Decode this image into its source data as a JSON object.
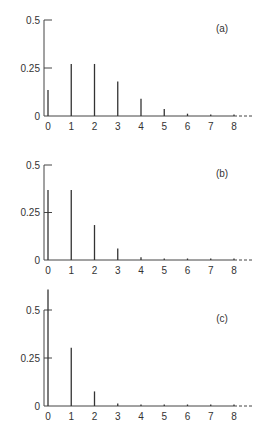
{
  "chart_data": [
    {
      "type": "bar",
      "panel_label": "(a)",
      "title": "",
      "xlabel": "",
      "ylabel": "",
      "categories": [
        "0",
        "1",
        "2",
        "3",
        "4",
        "5",
        "6",
        "7",
        "8"
      ],
      "values": [
        0.135,
        0.271,
        0.271,
        0.18,
        0.09,
        0.036,
        0.012,
        0.003,
        0.001
      ],
      "yticks": [
        0,
        0.25,
        0.5
      ],
      "ytick_labels": [
        "0",
        "0.25",
        "0.5"
      ],
      "ylim": [
        0,
        0.5
      ],
      "x_axis_continues": true,
      "grid": false,
      "legend": null
    },
    {
      "type": "bar",
      "panel_label": "(b)",
      "title": "",
      "xlabel": "",
      "ylabel": "",
      "categories": [
        "0",
        "1",
        "2",
        "3",
        "4",
        "5",
        "6",
        "7",
        "8"
      ],
      "values": [
        0.368,
        0.368,
        0.184,
        0.061,
        0.015,
        0.003,
        0.001,
        0.0,
        0.0
      ],
      "yticks": [
        0,
        0.25,
        0.5
      ],
      "ytick_labels": [
        "0",
        "0.25",
        "0.5"
      ],
      "ylim": [
        0,
        0.5
      ],
      "x_axis_continues": true,
      "grid": false,
      "legend": null
    },
    {
      "type": "bar",
      "panel_label": "(c)",
      "title": "",
      "xlabel": "",
      "ylabel": "",
      "categories": [
        "0",
        "1",
        "2",
        "3",
        "4",
        "5",
        "6",
        "7",
        "8"
      ],
      "values": [
        0.607,
        0.303,
        0.076,
        0.013,
        0.002,
        0.0,
        0.0,
        0.0,
        0.0
      ],
      "yticks": [
        0,
        0.25,
        0.5
      ],
      "ytick_labels": [
        "0",
        "0.25",
        "0.5"
      ],
      "ylim": [
        0,
        0.5
      ],
      "x_axis_continues": true,
      "grid": false,
      "legend": null
    }
  ],
  "layout": {
    "panels": [
      {
        "baseline_y": 116,
        "top_y": 20
      },
      {
        "baseline_y": 260,
        "top_y": 165
      },
      {
        "baseline_y": 406,
        "top_y": 310
      }
    ],
    "x0": 48,
    "x_step": 23.25,
    "axis_x": 44,
    "axis_end_x": 234,
    "dash_end_x": 252
  },
  "colors": {
    "ink": "#333333",
    "background": "#ffffff"
  }
}
